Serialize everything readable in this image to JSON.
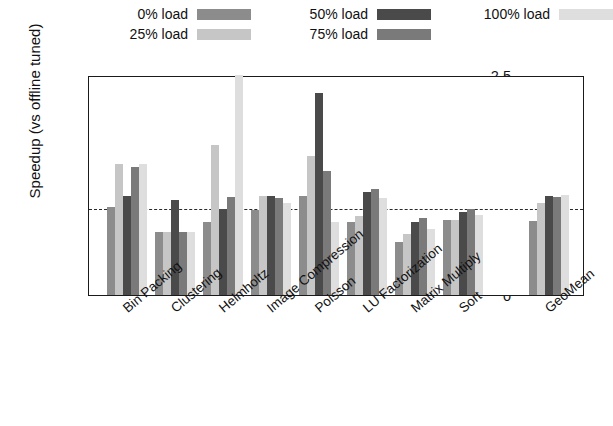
{
  "chart_data": {
    "type": "bar",
    "title": "",
    "xlabel": "",
    "ylabel": "Speedup (vs offline tuned)",
    "ylim": [
      0,
      2.5
    ],
    "yticks": [
      "0",
      "0.5",
      "1",
      "1.5",
      "2",
      "2.5"
    ],
    "ytick_values": [
      0,
      0.5,
      1,
      1.5,
      2,
      2.5
    ],
    "grid": false,
    "legend_position": "top",
    "reference_line": 1.0,
    "categories": [
      "Bin Packing",
      "Clustering",
      "Helmholtz",
      "Image Compression",
      "Poisson",
      "LU Factorization",
      "Matrix Multiply",
      "Sort",
      "GeoMean"
    ],
    "series": [
      {
        "name": "0% load",
        "color": "#8c8c8c",
        "values": [
          1.0,
          0.72,
          0.83,
          0.97,
          1.13,
          0.83,
          0.6,
          0.85,
          0.84
        ]
      },
      {
        "name": "25% load",
        "color": "#c6c6c6",
        "values": [
          1.49,
          0.72,
          1.7,
          1.12,
          1.58,
          0.9,
          0.69,
          0.85,
          1.05
        ]
      },
      {
        "name": "50% load",
        "color": "#4a4a4a",
        "values": [
          1.12,
          1.08,
          0.98,
          1.13,
          2.3,
          1.17,
          0.83,
          0.94,
          1.12
        ]
      },
      {
        "name": "75% load",
        "color": "#7a7a7a",
        "values": [
          1.45,
          0.72,
          1.11,
          1.1,
          1.41,
          1.21,
          0.87,
          0.98,
          1.11
        ]
      },
      {
        "name": "100% load",
        "color": "#dedede",
        "values": [
          1.49,
          0.72,
          2.5,
          1.05,
          0.83,
          1.1,
          0.75,
          0.91,
          1.14
        ]
      }
    ]
  },
  "legend": {
    "columns": [
      [
        {
          "label": "0% load",
          "color": "#8c8c8c"
        },
        {
          "label": "25% load",
          "color": "#c6c6c6"
        }
      ],
      [
        {
          "label": "50% load",
          "color": "#4a4a4a"
        },
        {
          "label": "75% load",
          "color": "#7a7a7a"
        }
      ],
      [
        {
          "label": "100% load",
          "color": "#dedede"
        }
      ]
    ]
  }
}
